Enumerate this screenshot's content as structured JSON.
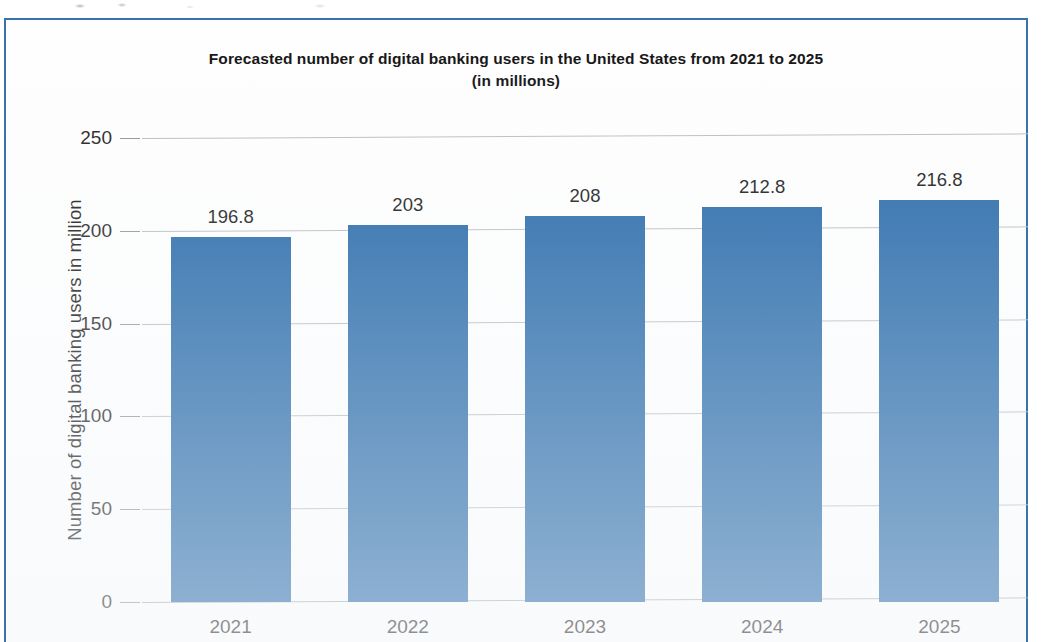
{
  "frame": {
    "border_color": "#3a72ad"
  },
  "chart_data": {
    "type": "bar",
    "title": "Forecasted number of digital banking users in the United States from 2021 to 2025 (in millions)",
    "title_line1": "Forecasted number of digital banking users in the United States from 2021 to 2025",
    "title_line2": "(in millions)",
    "xlabel": "",
    "ylabel": "Number of digital banking users in million",
    "categories": [
      "2021",
      "2022",
      "2023",
      "2024",
      "2025"
    ],
    "values": [
      196.8,
      203,
      208,
      212.8,
      216.8
    ],
    "value_labels": [
      "196.8",
      "203",
      "208",
      "212.8",
      "216.8"
    ],
    "ylim": [
      0,
      250
    ],
    "yticks": [
      0,
      50,
      100,
      150,
      200,
      250
    ],
    "ytick_labels": [
      "0",
      "50",
      "100",
      "150",
      "200",
      "250"
    ],
    "grid": true,
    "legend": false,
    "bar_color": "#2065a6",
    "gridline_color": "#b9bcc0"
  }
}
